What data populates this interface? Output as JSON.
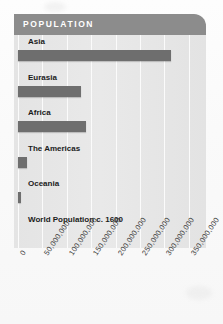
{
  "chart_data": {
    "type": "bar",
    "orientation": "horizontal",
    "title": "POPULATION",
    "xlabel": "",
    "ylabel": "",
    "categories": [
      "Asia",
      "Eurasia",
      "Africa",
      "The Americas",
      "Oceania",
      "World Population c. 1600"
    ],
    "values": [
      313000000,
      129000000,
      139000000,
      19000000,
      7000000,
      null
    ],
    "xlim": [
      0,
      375000000
    ],
    "xticks": [
      0,
      50000000,
      100000000,
      150000000,
      200000000,
      250000000,
      300000000,
      350000000
    ],
    "xtick_labels": [
      "0",
      "50,000,000",
      "100,000,000",
      "150,000,000",
      "200,000,000",
      "250,000,000",
      "300,000,000",
      "350,000,000"
    ],
    "grid": true,
    "legend": false,
    "bar_color": "#6e6e6e",
    "plot_background": "#e6e6e6",
    "header_color": "#8c8c8c",
    "title_color": "#ffffff"
  }
}
